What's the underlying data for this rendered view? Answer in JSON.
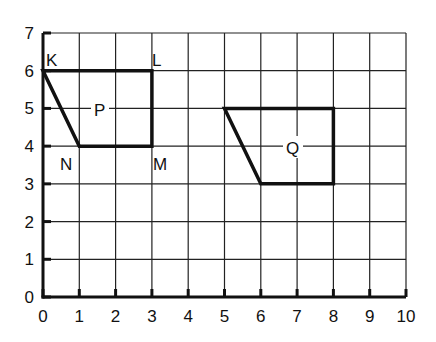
{
  "chart_data": {
    "type": "diagram",
    "title": "",
    "x_axis": {
      "min": 0,
      "max": 10,
      "ticks": [
        "0",
        "1",
        "2",
        "3",
        "4",
        "5",
        "6",
        "7",
        "8",
        "9",
        "10"
      ]
    },
    "y_axis": {
      "min": 0,
      "max": 7,
      "ticks": [
        "0",
        "1",
        "2",
        "3",
        "4",
        "5",
        "6",
        "7"
      ]
    },
    "grid": true,
    "shapes": [
      {
        "name": "P",
        "label_position": [
          1.6,
          5
        ],
        "vertices": [
          {
            "label": "K",
            "x": 0,
            "y": 6
          },
          {
            "label": "L",
            "x": 3,
            "y": 6
          },
          {
            "label": "M",
            "x": 3,
            "y": 4
          },
          {
            "label": "N",
            "x": 1,
            "y": 4
          }
        ]
      },
      {
        "name": "Q",
        "label_position": [
          7,
          4
        ],
        "vertices": [
          {
            "label": "",
            "x": 5,
            "y": 5
          },
          {
            "label": "",
            "x": 8,
            "y": 5
          },
          {
            "label": "",
            "x": 8,
            "y": 3
          },
          {
            "label": "",
            "x": 6,
            "y": 3
          }
        ]
      }
    ]
  },
  "labels": {
    "K": "K",
    "L": "L",
    "M": "M",
    "N": "N",
    "P": "P",
    "Q": "Q"
  },
  "x_ticks": [
    "0",
    "1",
    "2",
    "3",
    "4",
    "5",
    "6",
    "7",
    "8",
    "9",
    "10"
  ],
  "y_ticks": [
    "0",
    "1",
    "2",
    "3",
    "4",
    "5",
    "6",
    "7"
  ]
}
